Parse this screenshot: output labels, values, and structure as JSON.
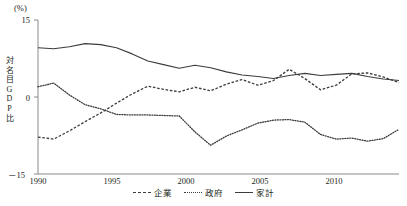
{
  "axes": {
    "unit_label": "(%)",
    "ylabel_chars": [
      "対",
      "名",
      "目",
      "G",
      "D",
      "P",
      "比"
    ],
    "yticks": [
      "15",
      "0",
      "－15"
    ],
    "xticks": [
      "1990",
      "1995",
      "2000",
      "2005",
      "2010"
    ]
  },
  "legend": {
    "items": [
      {
        "label": "企業",
        "style": "dash",
        "swatch": "dashed-line-swatch"
      },
      {
        "label": "政府",
        "style": "dot",
        "swatch": "dotted-line-swatch"
      },
      {
        "label": "家計",
        "style": "solid",
        "swatch": "solid-line-swatch"
      }
    ]
  },
  "chart_data": {
    "type": "line",
    "title": "",
    "xlabel": "",
    "ylabel": "対名目GDP比",
    "unit": "%",
    "xlim": [
      1990,
      2013
    ],
    "ylim": [
      -15,
      15
    ],
    "yticks": [
      -15,
      0,
      15
    ],
    "xticks": [
      1990,
      1995,
      2000,
      2005,
      2010
    ],
    "grid": false,
    "legend_position": "bottom-center",
    "x": [
      1990,
      1991,
      1992,
      1993,
      1994,
      1995,
      1996,
      1997,
      1998,
      1999,
      2000,
      2001,
      2002,
      2003,
      2004,
      2005,
      2006,
      2007,
      2008,
      2009,
      2010,
      2011,
      2012,
      2013
    ],
    "series": [
      {
        "name": "企業",
        "style": "dashed",
        "color": "#3c3c3c",
        "values": [
          -7.8,
          -8.2,
          -6.6,
          -4.8,
          -3.1,
          -1.2,
          0.6,
          2.1,
          1.5,
          1.0,
          1.9,
          1.2,
          2.5,
          3.4,
          2.3,
          3.2,
          5.4,
          3.6,
          1.4,
          2.3,
          4.5,
          4.7,
          3.9,
          2.8
        ]
      },
      {
        "name": "政府",
        "style": "dotted",
        "color": "#3c3c3c",
        "values": [
          2.0,
          2.7,
          0.4,
          -1.5,
          -2.3,
          -3.4,
          -3.5,
          -3.5,
          -3.6,
          -3.7,
          -6.8,
          -9.4,
          -7.6,
          -6.4,
          -5.1,
          -4.5,
          -4.4,
          -4.9,
          -7.3,
          -8.2,
          -8.0,
          -8.6,
          -8.1,
          -6.3
        ]
      },
      {
        "name": "家計",
        "style": "solid",
        "color": "#3c3c3c",
        "values": [
          9.6,
          9.4,
          9.8,
          10.4,
          10.2,
          9.6,
          8.4,
          7.0,
          6.3,
          5.6,
          6.2,
          5.7,
          4.9,
          4.3,
          4.0,
          3.6,
          4.2,
          4.6,
          4.2,
          4.4,
          4.6,
          4.0,
          3.5,
          3.2
        ]
      }
    ]
  }
}
